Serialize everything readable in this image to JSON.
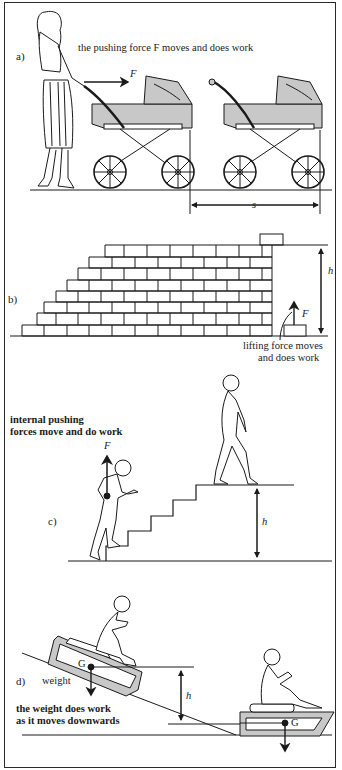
{
  "figure": {
    "panels": [
      {
        "id": "a",
        "label": "a)",
        "caption": "the pushing force  F moves and does work",
        "force_label": "F",
        "distance_label": "s"
      },
      {
        "id": "b",
        "label": "b)",
        "caption_line1": "lifting force moves",
        "caption_line2": "and does work",
        "force_label": "F",
        "height_label": "h"
      },
      {
        "id": "c",
        "label": "c)",
        "caption_line1": "internal pushing",
        "caption_line2": "forces move and do work",
        "force_label": "F",
        "height_label": "h"
      },
      {
        "id": "d",
        "label": "d)",
        "weight_label": "weight",
        "caption_line1": "the weight does work",
        "caption_line2": "as it moves downwards",
        "centre_label_1": "G",
        "centre_label_2": "G",
        "height_label": "h"
      }
    ]
  },
  "colors": {
    "line": "#1a1a1a",
    "shade": "#c8c8c8",
    "background": "#ffffff"
  }
}
